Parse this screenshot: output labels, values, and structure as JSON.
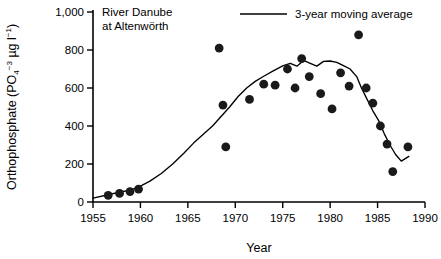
{
  "figure": {
    "annotation_line1": "River Danube",
    "annotation_line2": "at Altenwörth",
    "background": "#ffffff",
    "ink": "#000000",
    "point_color": "#1a1a1a"
  },
  "legend": {
    "position": "top-right",
    "entries": [
      {
        "label": "3-year moving average",
        "marker": "line"
      }
    ]
  },
  "axes": {
    "x": {
      "label": "Year",
      "min": 1955,
      "max": 1990,
      "ticks": [
        1955,
        1960,
        1965,
        1970,
        1975,
        1980,
        1985,
        1990
      ],
      "ticklabels": [
        "1955",
        "1960",
        "1965",
        "1970",
        "1975",
        "1980",
        "1985",
        "1990"
      ]
    },
    "y": {
      "label_main": "Orthophosphate (PO",
      "label_sub": "4",
      "label_sup": "−3",
      "label_units": " µg l",
      "label_units_sup": "−1",
      "label_close": ")",
      "label_plain": "Orthophosphate (PO4-3 µg l-1)",
      "min": 0,
      "max": 1000,
      "ticks": [
        0,
        200,
        400,
        600,
        800,
        1000
      ],
      "ticklabels": [
        "0",
        "200",
        "400",
        "600",
        "800",
        "1,000"
      ]
    },
    "grid": false
  },
  "chart_data": {
    "type": "scatter",
    "title": "River Danube at Altenwörth",
    "xlabel": "Year",
    "ylabel": "Orthophosphate (PO4-3 µg l-1)",
    "xlim": [
      1955,
      1990
    ],
    "ylim": [
      0,
      1000
    ],
    "grid": false,
    "legend_position": "top-right",
    "series": [
      {
        "name": "Orthophosphate observations",
        "type": "scatter",
        "marker": "filled-circle",
        "color": "#1a1a1a",
        "x": [
          1956.6,
          1957.8,
          1958.9,
          1959.8,
          1968.3,
          1968.7,
          1969.0,
          1971.5,
          1973.0,
          1974.2,
          1975.5,
          1976.3,
          1977.0,
          1977.8,
          1979.0,
          1980.2,
          1981.1,
          1982.0,
          1983.0,
          1983.8,
          1984.5,
          1985.3,
          1986.0,
          1986.6,
          1988.2
        ],
        "y": [
          35,
          45,
          55,
          68,
          810,
          510,
          290,
          540,
          620,
          615,
          700,
          600,
          755,
          660,
          570,
          490,
          680,
          610,
          880,
          600,
          520,
          400,
          305,
          160,
          290
        ]
      },
      {
        "name": "3-year moving average",
        "type": "line",
        "color": "#000000",
        "x": [
          1955.0,
          1956.6,
          1957.8,
          1958.9,
          1959.8,
          1961.0,
          1962.2,
          1963.4,
          1964.6,
          1965.6,
          1966.6,
          1967.6,
          1968.5,
          1969.4,
          1970.3,
          1971.2,
          1972.1,
          1973.0,
          1974.0,
          1975.0,
          1975.8,
          1976.5,
          1977.2,
          1977.9,
          1978.6,
          1979.3,
          1980.0,
          1980.7,
          1981.4,
          1982.1,
          1982.8,
          1983.3,
          1983.9,
          1984.5,
          1985.1,
          1985.7,
          1986.3,
          1986.9,
          1987.5,
          1988.3
        ],
        "y": [
          20,
          38,
          52,
          62,
          78,
          110,
          150,
          200,
          258,
          310,
          355,
          400,
          450,
          500,
          555,
          600,
          635,
          662,
          690,
          716,
          730,
          715,
          745,
          730,
          715,
          740,
          742,
          735,
          718,
          700,
          660,
          600,
          540,
          480,
          430,
          360,
          300,
          250,
          215,
          240
        ]
      }
    ]
  }
}
